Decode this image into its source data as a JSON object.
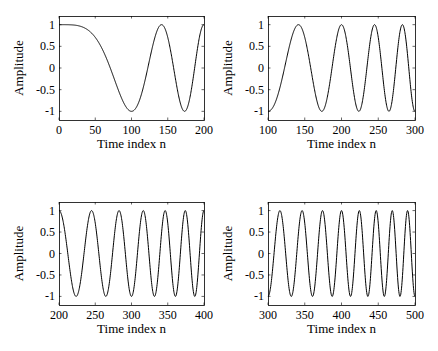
{
  "figure": {
    "width": 438,
    "height": 351,
    "background": "#ffffff",
    "line_color": "#000000"
  },
  "chart_data": [
    {
      "type": "line",
      "panel": "top-left",
      "title": "",
      "xlabel": "Time index n",
      "ylabel": "Amplitude",
      "xlim": [
        0,
        200
      ],
      "ylim": [
        -1.2,
        1.2
      ],
      "xticks": [
        0,
        50,
        100,
        150,
        200
      ],
      "xticklabels": [
        "0",
        "50",
        "100",
        "150",
        "200"
      ],
      "yticks": [
        1,
        0.5,
        0,
        -0.5,
        -1
      ],
      "yticklabels": [
        "1",
        "0.5",
        "0",
        "-0.5",
        "-1"
      ],
      "grid": false,
      "signal": "x[n] = cos(pi * n^2 / 10000)",
      "series": [
        {
          "name": "chirp",
          "x": [
            0,
            5,
            10,
            15,
            20,
            25,
            30,
            35,
            40,
            45,
            50,
            55,
            60,
            65,
            70,
            75,
            80,
            85,
            90,
            95,
            100,
            105,
            110,
            115,
            120,
            125,
            130,
            135,
            140,
            145,
            150,
            155,
            160,
            165,
            170,
            175,
            180,
            185,
            190,
            195,
            200
          ],
          "values": [
            1,
            1.0,
            0.9995,
            0.9975,
            0.9921,
            0.9808,
            0.9603,
            0.9269,
            0.8763,
            0.8044,
            0.7071,
            0.5812,
            0.4258,
            0.2412,
            0.0314,
            -0.1951,
            -0.4258,
            -0.6433,
            -0.8271,
            -0.953,
            -1,
            -0.9511,
            -0.7902,
            -0.5264,
            -0.1874,
            0.1951,
            0.5621,
            0.8486,
            0.9921,
            0.9511,
            0.7071,
            0.309,
            -0.1874,
            -0.6494,
            -0.9417,
            -0.9808,
            -0.729,
            -0.2334,
            0.3256,
            0.788,
            1
          ]
        }
      ]
    },
    {
      "type": "line",
      "panel": "top-right",
      "title": "",
      "xlabel": "Time index n",
      "ylabel": "Amplitude",
      "xlim": [
        100,
        300
      ],
      "ylim": [
        -1.2,
        1.2
      ],
      "xticks": [
        100,
        150,
        200,
        250,
        300
      ],
      "xticklabels": [
        "100",
        "150",
        "200",
        "250",
        "300"
      ],
      "yticks": [
        1,
        0.5,
        0,
        -0.5,
        -1
      ],
      "yticklabels": [
        "1",
        "0.5",
        "0",
        "-0.5",
        "-1"
      ],
      "grid": false,
      "signal": "x[n] = cos(pi * n^2 / 10000)",
      "series": [
        {
          "name": "chirp",
          "peaks_at_n": [
            141,
            200,
            245,
            283
          ],
          "troughs_at_n": [
            100,
            173,
            224,
            265,
            300
          ]
        }
      ]
    },
    {
      "type": "line",
      "panel": "bottom-left",
      "title": "",
      "xlabel": "Time index n",
      "ylabel": "Amplitude",
      "xlim": [
        200,
        400
      ],
      "ylim": [
        -1.2,
        1.2
      ],
      "xticks": [
        200,
        250,
        300,
        350,
        400
      ],
      "xticklabels": [
        "200",
        "250",
        "300",
        "350",
        "400"
      ],
      "yticks": [
        1,
        0.5,
        0,
        -0.5,
        -1
      ],
      "yticklabels": [
        "1",
        "0.5",
        "0",
        "-0.5",
        "-1"
      ],
      "grid": false,
      "signal": "x[n] = cos(pi * n^2 / 10000)",
      "series": [
        {
          "name": "chirp",
          "peaks_at_n": [
            200,
            245,
            283,
            316,
            346,
            374,
            400
          ],
          "troughs_at_n": [
            224,
            265,
            300,
            332,
            361,
            387
          ]
        }
      ]
    },
    {
      "type": "line",
      "panel": "bottom-right",
      "title": "",
      "xlabel": "Time index n",
      "ylabel": "Amplitude",
      "xlim": [
        300,
        500
      ],
      "ylim": [
        -1.2,
        1.2
      ],
      "xticks": [
        300,
        350,
        400,
        450,
        500
      ],
      "xticklabels": [
        "300",
        "350",
        "400",
        "450",
        "500"
      ],
      "yticks": [
        1,
        0.5,
        0,
        -0.5,
        -1
      ],
      "yticklabels": [
        "1",
        "0.5",
        "0",
        "-0.5",
        "-1"
      ],
      "grid": false,
      "signal": "x[n] = cos(pi * n^2 / 10000)",
      "series": [
        {
          "name": "chirp",
          "peaks_at_n": [
            316,
            346,
            374,
            400,
            424,
            447,
            469,
            490
          ],
          "troughs_at_n": [
            300,
            332,
            361,
            387,
            412,
            436,
            458,
            480,
            500
          ]
        }
      ]
    }
  ],
  "signal_model": {
    "formula": "cos(pi * n^2 / 10000)",
    "coefficient": 0.0001
  },
  "layout": {
    "axes": [
      {
        "left": 59,
        "top": 16,
        "right": 204,
        "bottom": 120
      },
      {
        "left": 268,
        "top": 16,
        "right": 415,
        "bottom": 120
      },
      {
        "left": 59,
        "top": 202,
        "right": 204,
        "bottom": 305
      },
      {
        "left": 268,
        "top": 202,
        "right": 415,
        "bottom": 305
      }
    ]
  }
}
